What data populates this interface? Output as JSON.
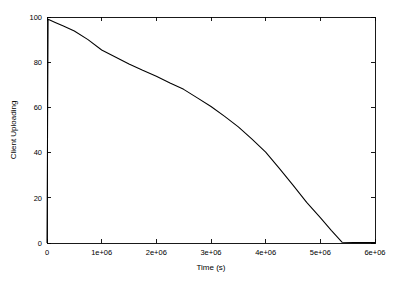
{
  "chart_data": {
    "type": "line",
    "title": "",
    "xlabel": "Time (s)",
    "ylabel": "Client Uploading",
    "xlim": [
      0,
      6000000
    ],
    "ylim": [
      0,
      100
    ],
    "grid": false,
    "legend": null,
    "background_color": "#ffffff",
    "line_color": "#000000",
    "xticks": [
      0,
      1000000,
      2000000,
      3000000,
      4000000,
      5000000,
      6000000
    ],
    "xticklabels": [
      "0",
      "1e+06",
      "2e+06",
      "3e+06",
      "4e+06",
      "5e+06",
      "6e+06"
    ],
    "yticks": [
      0,
      20,
      40,
      60,
      80,
      100
    ],
    "yticklabels": [
      "0",
      "20",
      "40",
      "60",
      "80",
      "100"
    ],
    "series": [
      {
        "name": "Client Uploading",
        "x": [
          0,
          20000,
          60000,
          150000,
          300000,
          500000,
          750000,
          1000000,
          1250000,
          1500000,
          1750000,
          2000000,
          2250000,
          2500000,
          2750000,
          3000000,
          3250000,
          3500000,
          3750000,
          4000000,
          4250000,
          4500000,
          4750000,
          5000000,
          5200000,
          5400000,
          5600000,
          5800000,
          6000000
        ],
        "y": [
          0,
          99,
          98.6,
          97.6,
          96.0,
          93.8,
          90.0,
          85.4,
          82.3,
          79.2,
          76.4,
          73.8,
          70.8,
          68.0,
          64.2,
          60.4,
          56.0,
          51.4,
          46.0,
          40.2,
          33.0,
          25.6,
          18.0,
          11.2,
          5.6,
          0.3,
          0.2,
          0.2,
          0.2
        ]
      }
    ]
  },
  "axes": {
    "x_title": "Time (s)",
    "y_title": "Client Uploading"
  }
}
